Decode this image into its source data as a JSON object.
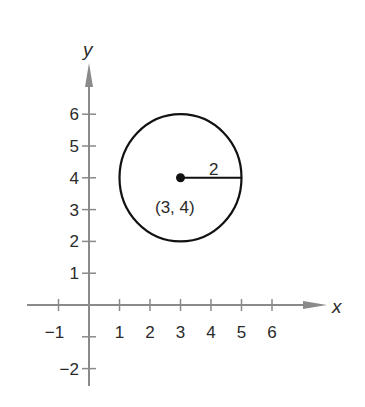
{
  "chart_data": {
    "type": "scatter",
    "title": "",
    "xlabel": "x",
    "ylabel": "y",
    "xlim": [
      -1,
      6
    ],
    "ylim": [
      -2,
      6
    ],
    "grid": false,
    "x_ticks": [
      -1,
      1,
      2,
      3,
      4,
      5,
      6
    ],
    "x_tick_labels": [
      "−1",
      "1",
      "2",
      "3",
      "4",
      "5",
      "6"
    ],
    "y_ticks": [
      -2,
      -1,
      1,
      2,
      3,
      4,
      5,
      6
    ],
    "y_tick_labels": [
      "−2",
      "",
      "1",
      "2",
      "3",
      "4",
      "5",
      "6"
    ],
    "shapes": [
      {
        "kind": "circle",
        "center": [
          3,
          4
        ],
        "radius": 2
      }
    ],
    "points": [
      {
        "x": 3,
        "y": 4,
        "label": "(3, 4)"
      }
    ],
    "segments": [
      {
        "from": [
          3,
          4
        ],
        "to": [
          5,
          4
        ],
        "label": "2"
      }
    ],
    "annotations": [
      "(3, 4)",
      "2"
    ]
  },
  "labels": {
    "x_axis": "x",
    "y_axis": "y",
    "center": "(3, 4)",
    "radius": "2"
  },
  "colors": {
    "axis": "#8a8a8a",
    "circle": "#111111",
    "text": "#2a2a2a"
  }
}
